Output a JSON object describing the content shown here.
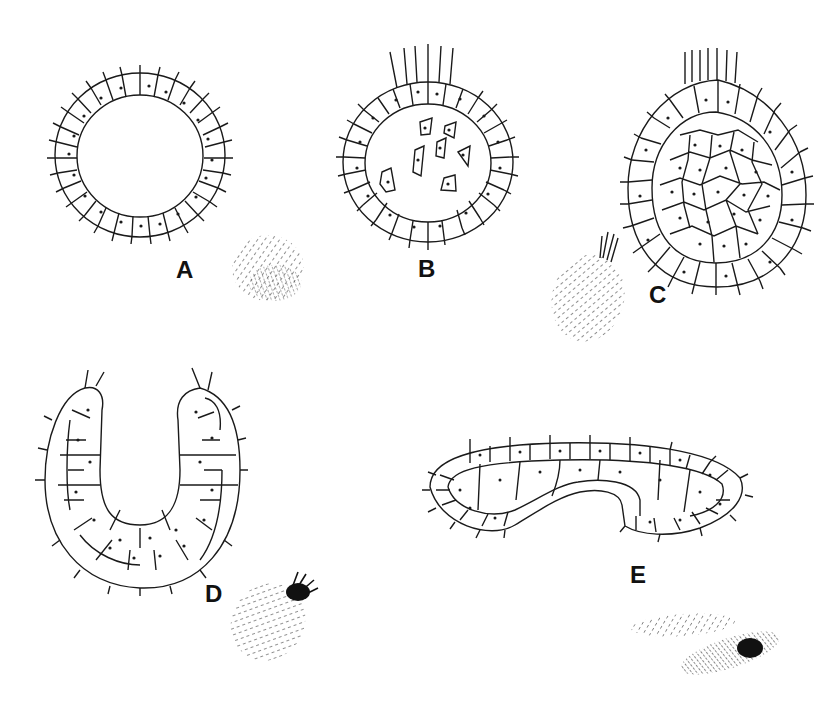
{
  "figure": {
    "type": "developmental-stages-illustration",
    "panels": [
      {
        "id": "A",
        "label": "A",
        "description": "Hollow single-layer ciliated sphere (blastula) with small whole-body view",
        "label_pos": [
          248,
          267
        ]
      },
      {
        "id": "B",
        "label": "B",
        "description": "Blastula with apical tuft of long cilia and scattered ingressing cells in the cavity",
        "label_pos": [
          418,
          267
        ]
      },
      {
        "id": "C",
        "label": "C",
        "description": "Solid ovoid larva with outer epithelium filled with inner cells, apical tuft; whole-body view",
        "label_pos": [
          650,
          285
        ]
      },
      {
        "id": "D",
        "label": "D",
        "description": "U-shaped cup-like larva, double-layered with ciliated outer cells; whole-body view with dark apical tuft",
        "label_pos": [
          205,
          590
        ]
      },
      {
        "id": "E",
        "label": "E",
        "description": "Elongated curved larva with invaginated end; two elongate whole-body views",
        "label_pos": [
          630,
          570
        ]
      }
    ]
  },
  "colors": {
    "ink": "#1a1a1a",
    "paper": "#ffffff"
  }
}
